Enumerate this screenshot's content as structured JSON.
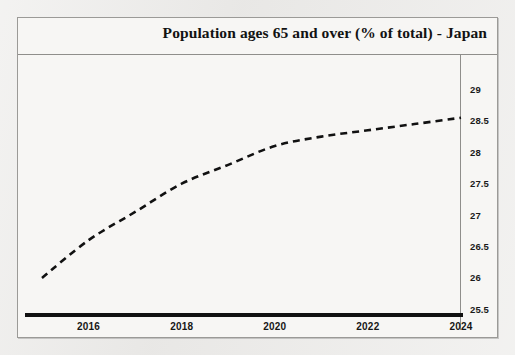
{
  "chart_data": {
    "type": "line",
    "title": "Population ages 65 and over (% of total) - Japan",
    "xlabel": "",
    "ylabel": "(%)",
    "source": "Data from The World Bank",
    "xlim": [
      2015,
      2024
    ],
    "ylim": [
      25.5,
      29
    ],
    "grid": false,
    "legend": "none",
    "line_style": "dashed",
    "line_color": "#111111",
    "x_ticks": [
      "2016",
      "2018",
      "2020",
      "2022",
      "2024"
    ],
    "y_ticks": [
      "29",
      "28.5",
      "28",
      "27.5",
      "27",
      "26.5",
      "26",
      "25.5"
    ],
    "x": [
      2015,
      2016,
      2017,
      2018,
      2019,
      2020,
      2021,
      2022,
      2023,
      2024
    ],
    "values": [
      26.0,
      26.6,
      27.05,
      27.5,
      27.8,
      28.1,
      28.25,
      28.35,
      28.45,
      28.55
    ],
    "series": [
      {
        "name": "Population ages 65 and over (% of total)",
        "values": [
          26.0,
          26.6,
          27.05,
          27.5,
          27.8,
          28.1,
          28.25,
          28.35,
          28.45,
          28.55
        ]
      }
    ]
  },
  "ghost_text": {
    "bottom": "a dulling went o see ning",
    "top": "populaton ages"
  }
}
